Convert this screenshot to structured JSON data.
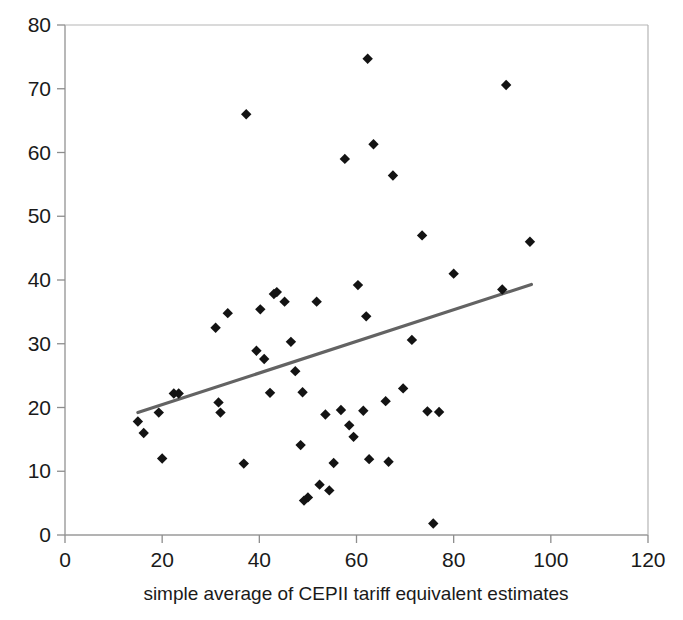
{
  "chart_data": {
    "type": "scatter",
    "title": "",
    "xlabel": "simple average of CEPII tariff equivalent estimates",
    "ylabel": "",
    "xlim": [
      0,
      120
    ],
    "ylim": [
      0,
      80
    ],
    "xticks": [
      0,
      20,
      40,
      60,
      80,
      100,
      120
    ],
    "yticks": [
      0,
      10,
      20,
      30,
      40,
      50,
      60,
      70,
      80
    ],
    "grid": false,
    "legend": false,
    "marker_shape": "diamond",
    "marker_color": "#131313",
    "series": [
      {
        "name": "observations",
        "points": [
          [
            15.0,
            17.8
          ],
          [
            16.2,
            16.0
          ],
          [
            19.3,
            19.2
          ],
          [
            20.0,
            12.0
          ],
          [
            22.4,
            22.2
          ],
          [
            23.4,
            22.2
          ],
          [
            31.0,
            32.5
          ],
          [
            31.6,
            20.8
          ],
          [
            32.0,
            19.2
          ],
          [
            33.5,
            34.8
          ],
          [
            36.8,
            11.2
          ],
          [
            37.3,
            66.0
          ],
          [
            39.4,
            28.9
          ],
          [
            40.2,
            35.4
          ],
          [
            41.0,
            27.6
          ],
          [
            42.2,
            22.3
          ],
          [
            43.0,
            37.8
          ],
          [
            43.6,
            38.1
          ],
          [
            45.2,
            36.6
          ],
          [
            46.5,
            30.3
          ],
          [
            47.4,
            25.7
          ],
          [
            48.5,
            14.1
          ],
          [
            48.9,
            22.4
          ],
          [
            49.2,
            5.4
          ],
          [
            50.0,
            5.9
          ],
          [
            51.8,
            36.6
          ],
          [
            52.4,
            7.9
          ],
          [
            53.6,
            18.9
          ],
          [
            54.4,
            7.0
          ],
          [
            55.3,
            11.3
          ],
          [
            56.8,
            19.6
          ],
          [
            57.6,
            59.0
          ],
          [
            58.5,
            17.2
          ],
          [
            59.4,
            15.4
          ],
          [
            60.3,
            39.2
          ],
          [
            61.4,
            19.5
          ],
          [
            62.0,
            34.3
          ],
          [
            62.3,
            74.7
          ],
          [
            62.6,
            11.9
          ],
          [
            63.5,
            61.3
          ],
          [
            66.0,
            21.0
          ],
          [
            66.6,
            11.5
          ],
          [
            67.5,
            56.4
          ],
          [
            69.6,
            23.0
          ],
          [
            71.4,
            30.6
          ],
          [
            73.5,
            47.0
          ],
          [
            74.6,
            19.4
          ],
          [
            75.8,
            1.8
          ],
          [
            77.0,
            19.3
          ],
          [
            80.0,
            41.0
          ],
          [
            90.0,
            38.5
          ],
          [
            90.8,
            70.6
          ],
          [
            95.7,
            46.0
          ]
        ]
      }
    ],
    "trendline": {
      "name": "linear fit",
      "color": "#636363",
      "x_start": 15.0,
      "y_start": 19.2,
      "x_end": 96.0,
      "y_end": 39.3
    }
  },
  "axes": {
    "x_tick_labels": [
      "0",
      "20",
      "40",
      "60",
      "80",
      "100",
      "120"
    ],
    "y_tick_labels": [
      "0",
      "10",
      "20",
      "30",
      "40",
      "50",
      "60",
      "70",
      "80"
    ],
    "x_axis_title": "simple average of CEPII tariff equivalent estimates"
  }
}
